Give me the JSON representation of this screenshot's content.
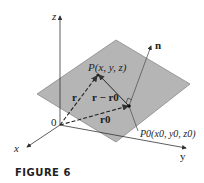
{
  "figure": {
    "caption": "FIGURE 6",
    "labels": {
      "z_axis": "z",
      "x_axis": "x",
      "y_axis": "y",
      "origin": "0",
      "normal": "n",
      "point_P": "P(x, y, z)",
      "point_P0": "P0(x0, y0, z0)",
      "vec_r": "r",
      "vec_r_minus_r0": "r − r0",
      "vec_r0": "r0"
    },
    "colors": {
      "plane_fill": "#b5b5b5",
      "plane_stroke": "#808080",
      "line": "#333333",
      "background": "#ffffff"
    }
  }
}
